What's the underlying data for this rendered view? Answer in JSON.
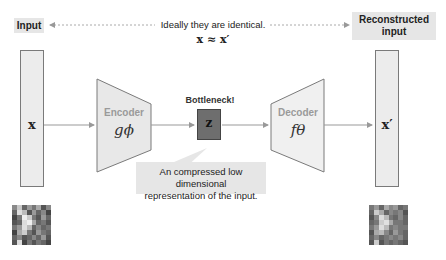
{
  "labels": {
    "input": "Input",
    "reconstructed": "Reconstructed\ninput",
    "reconstructed_line1": "Reconstructed",
    "reconstructed_line2": "input",
    "ideal_text": "Ideally they are identical.",
    "ideal_math": "x ≈ x′",
    "bottleneck": "Bottleneck!",
    "callout_line1": "An compressed low dimensional",
    "callout_line2": "representation of the input."
  },
  "nodes": {
    "input_vector": "x",
    "encoder": {
      "name": "Encoder",
      "symbol": "gϕ"
    },
    "latent": "z",
    "decoder": {
      "name": "Decoder",
      "symbol": "fθ"
    },
    "output_vector": "x′"
  },
  "colors": {
    "box_fill": "#e6e6e6",
    "column_fill": "#ececec",
    "trapezoid_fill": "#e8e8e8",
    "latent_fill": "#6e6e6e",
    "stroke": "#7a7a7a",
    "arrow": "#999999",
    "shape_text": "#9a9a9a"
  }
}
